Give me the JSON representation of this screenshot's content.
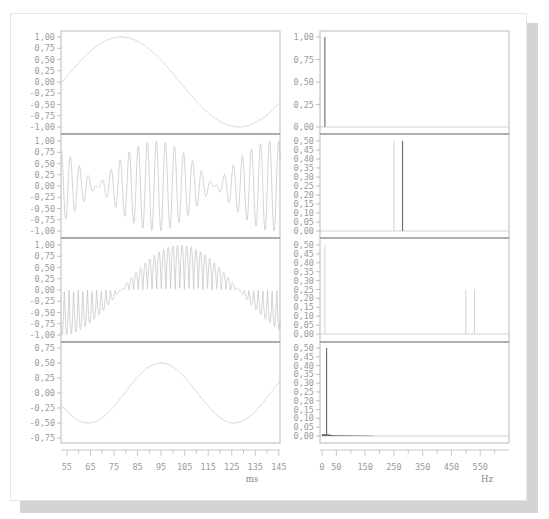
{
  "colors": {
    "card_background": "#ffffff",
    "shadow": "#d4d4d4",
    "frame": "#a8a8a8",
    "frame_separator": "#8c8c8c",
    "trace_light": "#c8c8c8",
    "trace_dark": "#6a6a6a",
    "tick_label": "#9a9a9a"
  },
  "chart_data": [
    {
      "type": "line",
      "panel": "time-1",
      "title": "",
      "xlabel": "",
      "ylabel": "",
      "xlim": [
        52.5,
        145.5
      ],
      "ylim": [
        -1.0,
        1.0
      ],
      "yticks": [
        "1,00",
        "0,75",
        "0,50",
        "0,25",
        "0,00",
        "-0,25",
        "-0,50",
        "-0,75",
        "-1,00"
      ],
      "series": [
        {
          "name": "sine",
          "formula": "sin",
          "amplitude": 1.0,
          "period_ms": 100,
          "peak_at_ms": 78
        }
      ]
    },
    {
      "type": "line",
      "panel": "time-2",
      "xlim": [
        52.5,
        145.5
      ],
      "ylim": [
        -1.0,
        1.0
      ],
      "yticks": [
        "1,00",
        "0,75",
        "0,50",
        "0,25",
        "0,00",
        "-0,25",
        "-0,50",
        "-0,75",
        "-1,00"
      ],
      "series": [
        {
          "name": "beat",
          "description": "sum of two ~0.5 amplitude sines near 250 Hz and 270 Hz (beating)",
          "carrier_hz": 260,
          "beat_hz": 20,
          "amplitude": 1.0
        }
      ]
    },
    {
      "type": "line",
      "panel": "time-3",
      "xlim": [
        52.5,
        145.5
      ],
      "ylim": [
        -1.0,
        1.0
      ],
      "yticks": [
        "1,00",
        "0,75",
        "0,50",
        "0,25",
        "0,00",
        "-0,25",
        "-0,50",
        "-0,75",
        "-1,00"
      ],
      "series": [
        {
          "name": "modulated",
          "description": "slow sine (~10 Hz) multiplied by rectified fast carrier (~510 Hz)",
          "envelope_period_ms": 100,
          "peak_at_ms": 78
        }
      ]
    },
    {
      "type": "line",
      "panel": "time-4",
      "xlabel": "ms",
      "xlim": [
        52.5,
        145.5
      ],
      "ylim": [
        -0.75,
        0.75
      ],
      "xticks": [
        "55",
        "65",
        "75",
        "85",
        "95",
        "105",
        "115",
        "125",
        "135",
        "145"
      ],
      "yticks": [
        "0,75",
        "0,50",
        "0,25",
        "0,00",
        "-0,25",
        "-0,50",
        "-0,75"
      ],
      "series": [
        {
          "name": "sine-small",
          "amplitude": 0.5,
          "period_ms": 62,
          "peak_at_ms": 95,
          "trough_at_ms": [
            64,
            126
          ]
        }
      ]
    },
    {
      "type": "bar",
      "panel": "spectrum-1",
      "xlim": [
        0,
        650
      ],
      "ylim": [
        0,
        1.0
      ],
      "yticks": [
        "1,00",
        "0,75",
        "0,50",
        "0,25",
        "0,00"
      ],
      "series": [
        {
          "name": "spectrum",
          "x": [
            10
          ],
          "values": [
            1.0
          ]
        }
      ]
    },
    {
      "type": "bar",
      "panel": "spectrum-2",
      "xlim": [
        0,
        650
      ],
      "ylim": [
        0,
        0.5
      ],
      "yticks": [
        "0,50",
        "0,45",
        "0,40",
        "0,35",
        "0,30",
        "0,25",
        "0,20",
        "0,15",
        "0,10",
        "0,05",
        "0,00"
      ],
      "series": [
        {
          "name": "spectrum",
          "x": [
            250,
            280
          ],
          "values": [
            0.5,
            0.5
          ]
        }
      ]
    },
    {
      "type": "bar",
      "panel": "spectrum-3",
      "xlim": [
        0,
        650
      ],
      "ylim": [
        0,
        0.5
      ],
      "yticks": [
        "0,50",
        "0,45",
        "0,40",
        "0,35",
        "0,30",
        "0,25",
        "0,20",
        "0,15",
        "0,10",
        "0,05",
        "0,00"
      ],
      "series": [
        {
          "name": "spectrum",
          "x": [
            10,
            500,
            530
          ],
          "values": [
            0.5,
            0.25,
            0.25
          ]
        }
      ]
    },
    {
      "type": "bar",
      "panel": "spectrum-4",
      "xlabel": "Hz",
      "xlim": [
        0,
        650
      ],
      "ylim": [
        0,
        0.5
      ],
      "xticks": [
        "0",
        "50",
        "150",
        "250",
        "350",
        "450",
        "550"
      ],
      "yticks": [
        "0,50",
        "0,45",
        "0,40",
        "0,35",
        "0,30",
        "0,25",
        "0,20",
        "0,15",
        "0,10",
        "0,05",
        "0,00"
      ],
      "series": [
        {
          "name": "spectrum",
          "x": [
            16
          ],
          "values": [
            0.5
          ],
          "noise_floor": {
            "x_range": [
              0,
              180
            ],
            "level": 0.01
          }
        }
      ]
    }
  ],
  "axes": {
    "left_xlabel": "ms",
    "right_xlabel": "Hz"
  }
}
